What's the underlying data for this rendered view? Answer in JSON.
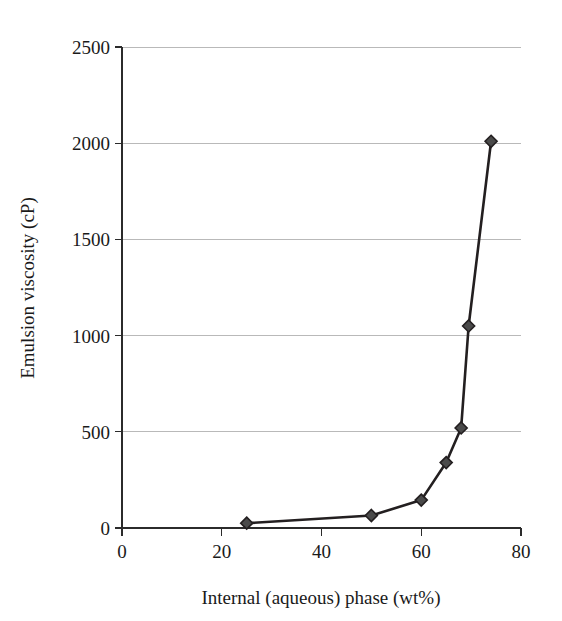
{
  "chart_data": {
    "type": "line",
    "title": "",
    "xlabel": "Internal (aqueous) phase (wt%)",
    "ylabel": "Emulsion viscosity (cP)",
    "xlim": [
      0,
      80
    ],
    "ylim": [
      0,
      2500
    ],
    "xticks": [
      0,
      20,
      40,
      60,
      80
    ],
    "yticks": [
      0,
      500,
      1000,
      1500,
      2000,
      2500
    ],
    "xtick_labels": [
      "0",
      "20",
      "40",
      "60",
      "80"
    ],
    "ytick_labels": [
      "0",
      "500",
      "1000",
      "1500",
      "2000",
      "2500"
    ],
    "grid": "horizontal",
    "legend": "none",
    "marker": "diamond",
    "line_color": "#231f20",
    "marker_color": "#4a4a4a",
    "grid_color": "#b9b9b9",
    "x": [
      25,
      50,
      60,
      65,
      68,
      69.5,
      74
    ],
    "values": [
      25,
      65,
      145,
      340,
      520,
      1050,
      2010
    ],
    "series": [
      {
        "name": "Emulsion viscosity",
        "points": [
          {
            "x": 25,
            "y": 25
          },
          {
            "x": 50,
            "y": 65
          },
          {
            "x": 60,
            "y": 145
          },
          {
            "x": 65,
            "y": 340
          },
          {
            "x": 68,
            "y": 520
          },
          {
            "x": 69.5,
            "y": 1050
          },
          {
            "x": 74,
            "y": 2010
          }
        ]
      }
    ]
  },
  "axes": {
    "x_title": "Internal (aqueous) phase (wt%)",
    "y_title": "Emulsion viscosity (cP)"
  }
}
